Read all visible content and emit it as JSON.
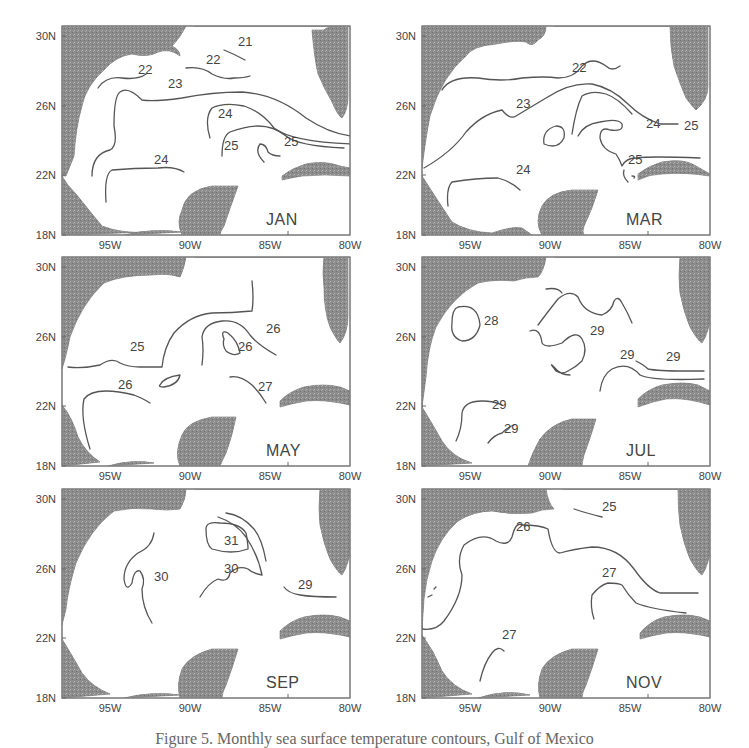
{
  "figure": {
    "caption": "Figure 5. Monthly sea surface temperature contours, Gulf of Mexico"
  },
  "axes": {
    "y_ticks": [
      "30N",
      "26N",
      "22N",
      "18N"
    ],
    "x_ticks": [
      "95W",
      "90W",
      "85W",
      "80W"
    ]
  },
  "chart_data": {
    "type": "contour-map",
    "title": "",
    "region": "Gulf of Mexico",
    "xlabel": "Longitude",
    "ylabel": "Latitude",
    "xlim": [
      "98W",
      "80W"
    ],
    "ylim": [
      "18N",
      "30N"
    ],
    "x_tick_labels": [
      "95W",
      "90W",
      "85W",
      "80W"
    ],
    "y_tick_labels": [
      "18N",
      "22N",
      "26N",
      "30N"
    ],
    "units": "°C (sea surface temperature isotherms)",
    "panels": [
      {
        "month": "JAN",
        "contour_labels": [
          21,
          22,
          22,
          23,
          24,
          24,
          25,
          25
        ]
      },
      {
        "month": "MAR",
        "contour_labels": [
          22,
          23,
          24,
          24,
          25,
          25
        ]
      },
      {
        "month": "MAY",
        "contour_labels": [
          25,
          26,
          26,
          26,
          27
        ]
      },
      {
        "month": "JUL",
        "contour_labels": [
          28,
          29,
          29,
          29,
          29,
          29
        ]
      },
      {
        "month": "SEP",
        "contour_labels": [
          29,
          30,
          30,
          31
        ]
      },
      {
        "month": "NOV",
        "contour_labels": [
          25,
          26,
          27,
          27
        ]
      }
    ]
  },
  "panels": [
    {
      "month": "JAN",
      "contours": [
        {
          "label": "21",
          "lx": 176,
          "ly": 20,
          "d": "M162 24 Q172 28 183 34"
        },
        {
          "label": "22",
          "lx": 144,
          "ly": 38,
          "d": "M124 42 Q140 40 150 48 Q162 54 172 52 Q182 52 188 50"
        },
        {
          "label": "22",
          "lx": 76,
          "ly": 48,
          "d": "M36 62 Q44 50 60 52 Q76 54 84 48"
        },
        {
          "label": "23",
          "lx": 106,
          "ly": 62,
          "d": "M30 150 Q30 128 48 124 Q56 120 52 100 Q52 70 58 66 Q66 60 80 74 Q92 76 120 72 Q150 66 180 66 Q214 68 244 92 Q268 108 290 110"
        },
        {
          "label": "24",
          "lx": 156,
          "ly": 92,
          "d": "M148 112 Q142 92 150 82 Q162 76 182 80 Q200 86 212 102 Q230 116 290 118"
        },
        {
          "label": "24",
          "lx": 92,
          "ly": 138,
          "d": "M44 176 Q42 148 50 144 Q72 142 96 142 Q112 140 122 146"
        },
        {
          "label": "25",
          "lx": 162,
          "ly": 124,
          "d": "M160 130 Q160 110 168 106 Q184 100 196 100 Q212 100 224 110 Q236 120 282 122"
        },
        {
          "label": "25",
          "lx": 222,
          "ly": 120,
          "d": "M202 136 Q192 126 198 118 Q204 118 206 126 Q210 130 218 130"
        }
      ],
      "land": [
        "M0 0 L124 0 Q118 12 110 20 Q118 24 118 30 Q108 22 96 26 Q86 32 70 28 Q54 30 42 44 Q24 60 20 80 Q14 100 12 130 Q8 140 4 150 L0 150 Z",
        "M0 150 Q4 158 14 168 Q30 188 40 200 Q60 208 88 206 L0 209 Z",
        "M62 209 Q90 202 120 206 L62 209 Z",
        "M132 0 L286 0 L286 0 Q264 0 262 4 L250 4 Q252 30 256 48 Q262 62 270 76 Q276 90 280 92 Q286 84 286 70 L286 0 Z",
        "M120 209 Q114 196 120 184 Q124 164 150 160 L176 160 Q168 182 162 200 Q158 206 158 209 Z",
        "M220 150 Q230 142 244 138 Q262 134 278 140 L288 142 L288 150 Q262 148 240 150 Q228 152 220 154 Z"
      ]
    },
    {
      "month": "MAR",
      "contours": [
        {
          "label": "22",
          "lx": 150,
          "ly": 46,
          "d": "M20 64 Q28 50 56 52 Q80 56 100 52 Q124 50 136 52 Q152 52 160 40 Q170 30 184 40 Q190 46 198 40"
        },
        {
          "label": "23",
          "lx": 94,
          "ly": 82,
          "d": "M2 142 Q30 126 44 106 Q60 88 80 84 Q88 94 94 90 Q104 84 124 72 Q148 56 170 58 Q190 62 206 78 Q220 92 238 98 L256 98"
        },
        {
          "label": "24",
          "lx": 224,
          "ly": 102,
          "d": "M150 108 Q154 82 160 70 Q170 64 184 68 Q196 72 210 88"
        },
        {
          "label": "25",
          "lx": 262,
          "ly": 104,
          "d": "M156 110 Q162 98 178 96 Q196 92 200 98 Q202 106 188 104 Q178 100 178 112 Q180 124 194 128 Q198 134 200 140 Q204 132 214 132 Q228 130 278 132"
        },
        {
          "label": "24",
          "lx": 94,
          "ly": 148,
          "d": "M26 180 Q24 162 30 156 Q54 152 76 152 Q90 156 98 164"
        },
        {
          "label": "25",
          "lx": 206,
          "ly": 138,
          "d": "M202 144 Q200 150 206 156 M210 150 Q214 150 212 152"
        },
        {
          "label": "",
          "lx": 0,
          "ly": 0,
          "d": "M122 118 Q120 104 134 100 Q144 100 142 112 Q136 124 122 118 Z"
        }
      ],
      "land": [
        "M0 0 L124 0 Q124 10 116 14 Q110 22 104 16 Q94 14 74 18 Q50 20 44 30 Q20 50 8 90 Q4 110 0 142 Z",
        "M0 150 Q14 172 30 196 Q46 206 70 207 Q90 200 100 202 L110 209 L0 209 Z",
        "M120 209 Q112 196 120 180 Q128 166 150 164 L176 164 Q170 184 162 200 Q160 206 162 209 Z",
        "M132 0 L248 0 Q248 20 252 40 Q258 58 264 72 Q270 80 274 84 Q286 74 286 60 L286 0 Z",
        "M216 148 Q226 140 240 136 Q262 132 274 140 L288 148 L288 150 Q262 146 240 148 Q228 148 216 154 Z"
      ]
    },
    {
      "month": "MAY",
      "contours": [
        {
          "label": "25",
          "lx": 68,
          "ly": 94,
          "d": "M6 110 Q20 112 38 108 Q50 100 58 106 Q66 110 78 110 L100 110 Q102 90 112 76 Q128 58 150 56 Q170 56 190 54 Q192 42 190 24"
        },
        {
          "label": "26",
          "lx": 56,
          "ly": 132,
          "d": "M28 192 Q18 160 22 142 Q28 134 44 134 Q56 134 72 138 Q82 142 88 146"
        },
        {
          "label": "26",
          "lx": 176,
          "ly": 94,
          "d": "M140 108 Q142 92 140 80 Q142 66 160 64 Q178 62 188 78 Q196 88 214 98"
        },
        {
          "label": "26",
          "lx": 204,
          "ly": 76,
          "d": ""
        },
        {
          "label": "27",
          "lx": 196,
          "ly": 134,
          "d": "M168 120 Q178 118 190 128 Q198 136 204 146"
        },
        {
          "label": "",
          "lx": 0,
          "ly": 0,
          "d": "M162 82 Q158 72 166 76 Q176 84 178 96 Q172 100 164 94 Q160 88 162 82 Z"
        },
        {
          "label": "",
          "lx": 0,
          "ly": 0,
          "d": "M98 128 Q102 120 118 118 Q116 128 102 130 Q96 130 98 128 Z"
        }
      ],
      "land": [
        "M0 0 L124 0 Q122 12 118 20 Q106 16 90 18 Q60 18 42 26 Q20 46 8 80 Q4 100 0 112 Z",
        "M0 148 Q10 160 16 180 Q24 196 38 205 L0 209 Z",
        "M46 209 Q70 202 92 206 L46 209 Z",
        "M118 209 Q112 196 120 178 Q126 164 150 160 L174 160 Q170 180 164 196 Q160 204 158 209 Z",
        "M132 0 L262 0 Q260 16 262 30 Q262 54 268 70 Q274 82 278 86 Q286 76 286 58 L286 0 Z",
        "M218 144 Q228 134 242 130 Q262 126 278 130 L288 134 L288 148 Q262 142 244 144 Q232 146 218 150 Z"
      ]
    },
    {
      "month": "JUL",
      "contours": [
        {
          "label": "28",
          "lx": 62,
          "ly": 68,
          "d": "M36 50 Q56 46 58 68 Q54 84 40 84 Q28 80 30 66 Q30 52 36 50 Z"
        },
        {
          "label": "29",
          "lx": 168,
          "ly": 78,
          "d": "M124 32 Q136 30 140 36 M116 68 Q128 52 136 42 Q148 32 156 40 Q162 56 180 58 Q190 54 192 44 Q196 38 200 46 Q206 56 210 66"
        },
        {
          "label": "29",
          "lx": 198,
          "ly": 102,
          "d": "M108 74 Q118 70 120 86 Q124 92 140 86 Q154 72 160 82 Q166 92 160 104 Q154 110 146 114 Q140 118 134 114 Q126 104 132 110 Q138 118 148 118"
        },
        {
          "label": "29",
          "lx": 244,
          "ly": 104,
          "d": "M214 104 Q222 108 226 112 Q236 114 262 114 L282 114 M178 134 Q180 118 190 112 Q206 104 218 118 Q230 124 282 122"
        },
        {
          "label": "29",
          "lx": 70,
          "ly": 152,
          "d": "M34 184 Q40 172 40 156 Q42 144 60 144 Q72 144 80 148"
        },
        {
          "label": "29",
          "lx": 82,
          "ly": 176,
          "d": "M66 186 Q72 178 80 176 Q86 170 92 168"
        }
      ],
      "land": [
        "M0 0 L124 0 Q122 14 116 20 Q104 20 92 24 Q72 22 56 26 Q30 40 14 70 Q6 90 4 120 L0 150 Z",
        "M0 150 Q10 166 20 184 Q30 200 50 206 L0 209 Z",
        "M106 209 Q110 196 118 182 Q130 166 150 162 L174 162 Q168 182 162 198 Q160 206 160 209 Z",
        "M132 0 L258 0 Q256 20 258 36 Q262 56 268 70 Q276 84 280 86 Q288 74 288 56 L288 0 Z",
        "M216 142 Q226 132 240 128 Q262 124 276 128 L288 134 L288 148 Q262 140 244 142 Q232 144 216 150 Z"
      ]
    },
    {
      "month": "SEP",
      "contours": [
        {
          "label": "30",
          "lx": 92,
          "ly": 92,
          "d": "M92 44 Q90 58 76 64 Q62 74 62 90 Q64 104 70 94 Q72 80 78 82 Q84 90 80 100 Q80 118 90 134"
        },
        {
          "label": "31",
          "lx": 162,
          "ly": 56,
          "d": "M144 40 Q144 32 158 34 Q178 34 184 44 Q186 54 186 60 Q170 66 150 60 Q144 56 144 40 Z"
        },
        {
          "label": "30",
          "lx": 162,
          "ly": 84,
          "d": "M138 108 Q146 94 156 90 Q166 94 168 84 Q176 76 186 80 Q190 84 200 86 Q196 66 184 48 Q174 34 156 28"
        },
        {
          "label": "",
          "lx": 0,
          "ly": 0,
          "d": "M164 24 Q180 26 192 40 Q200 50 204 72"
        },
        {
          "label": "29",
          "lx": 236,
          "ly": 100,
          "d": "M222 98 Q226 104 238 106 Q250 108 274 108"
        }
      ],
      "land": [
        "M0 0 L124 0 Q124 10 118 20 Q106 22 90 20 Q70 18 52 22 Q28 40 14 74 Q6 100 4 120 L0 136 Z",
        "M0 150 Q10 166 20 184 Q30 198 48 205 L0 209 Z",
        "M62 209 Q90 202 118 206 L62 209 Z",
        "M118 209 Q114 196 120 180 Q128 166 150 160 L176 160 Q170 180 164 196 Q160 204 160 209 Z",
        "M132 0 L258 0 Q256 20 258 36 Q262 56 268 70 Q276 84 280 86 Q288 74 288 56 L288 0 Z",
        "M218 142 Q228 132 242 128 Q262 124 278 128 L288 132 L288 148 Q262 142 244 144 Q232 146 218 150 Z"
      ]
    },
    {
      "month": "NOV",
      "contours": [
        {
          "label": "25",
          "lx": 180,
          "ly": 22,
          "d": "M152 20 Q164 24 180 28"
        },
        {
          "label": "26",
          "lx": 94,
          "ly": 42,
          "d": "M0 140 Q14 142 22 132 Q40 108 40 86 Q34 70 42 56 Q60 42 74 52 Q86 58 90 48 Q94 32 100 36 Q118 36 126 40 Q130 64 138 64 Q152 60 170 58 Q196 58 212 80 Q226 100 238 104 L276 104"
        },
        {
          "label": "27",
          "lx": 180,
          "ly": 88,
          "d": "M172 130 Q168 118 170 106 Q178 96 186 94 Q196 94 200 96 Q206 106 214 114 Q228 120 264 124"
        },
        {
          "label": "27",
          "lx": 80,
          "ly": 150,
          "d": "M58 192 Q62 174 70 164 Q76 156 82 162"
        },
        {
          "label": "",
          "lx": 0,
          "ly": 0,
          "d": "M6 108 L10 106 M12 100 L14 98"
        }
      ],
      "land": [
        "M0 0 L124 0 Q126 14 132 20 Q120 20 110 24 Q90 26 70 22 Q52 22 36 32 Q18 48 10 72 Q4 90 2 110 L0 140 Z",
        "M0 146 Q12 162 20 182 Q30 198 50 205 L0 209 Z",
        "M56 209 Q84 200 108 206 L56 209 Z",
        "M118 209 Q114 196 120 180 Q128 166 150 160 L176 160 Q170 180 164 196 Q160 204 160 209 Z",
        "M140 0 L256 0 Q256 20 258 36 Q262 56 268 70 Q276 84 280 86 Q288 74 288 56 L288 0 Z",
        "M218 144 Q228 132 242 128 Q262 124 278 128 L288 132 L288 148 Q262 142 244 144 Q232 146 218 150 Z"
      ]
    }
  ]
}
